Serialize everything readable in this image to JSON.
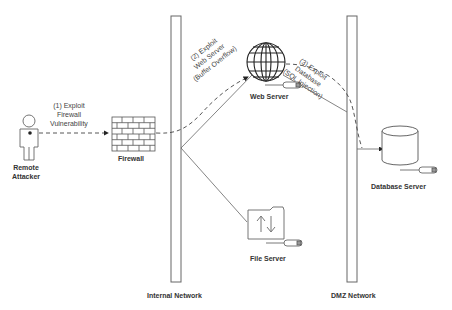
{
  "diagram": {
    "type": "network-attack-path",
    "nodes": {
      "attacker": {
        "label_line1": "Remote",
        "label_line2": "Attacker",
        "icon": "person-icon"
      },
      "firewall": {
        "label": "Firewall",
        "icon": "brick-wall-icon"
      },
      "web_server": {
        "label": "Web Server",
        "icon": "globe-icon"
      },
      "file_server": {
        "label": "File Server",
        "icon": "folder-transfer-icon"
      },
      "database_server": {
        "label": "Database Server",
        "icon": "database-cylinder-icon"
      }
    },
    "zones": {
      "internal": {
        "label": "Internal Network"
      },
      "dmz": {
        "label": "DMZ Network"
      }
    },
    "steps": {
      "step1": {
        "line1": "(1) Exploit",
        "line2": "Firewall",
        "line3": "Vulnerability"
      },
      "step2": {
        "line1": "(2) Exploit",
        "line2": "Web Server",
        "line3": "(Buffer Overflow)"
      },
      "step3": {
        "line1": "(3) Exploit",
        "line2": "Database",
        "line3": "(SQL Injection)"
      }
    },
    "edges": [
      {
        "from": "attacker",
        "to": "firewall",
        "style": "dashed-arrow"
      },
      {
        "from": "firewall",
        "to": "web_server",
        "style": "dashed-arrow"
      },
      {
        "from": "web_server",
        "to": "database_server",
        "style": "dashed-arrow"
      },
      {
        "from": "internal",
        "to": "web_server",
        "style": "solid"
      },
      {
        "from": "internal",
        "to": "file_server",
        "style": "solid"
      },
      {
        "from": "web_server",
        "to": "dmz",
        "style": "solid"
      }
    ],
    "colors": {
      "line": "#555555",
      "text": "#333333",
      "background": "#ffffff"
    }
  }
}
